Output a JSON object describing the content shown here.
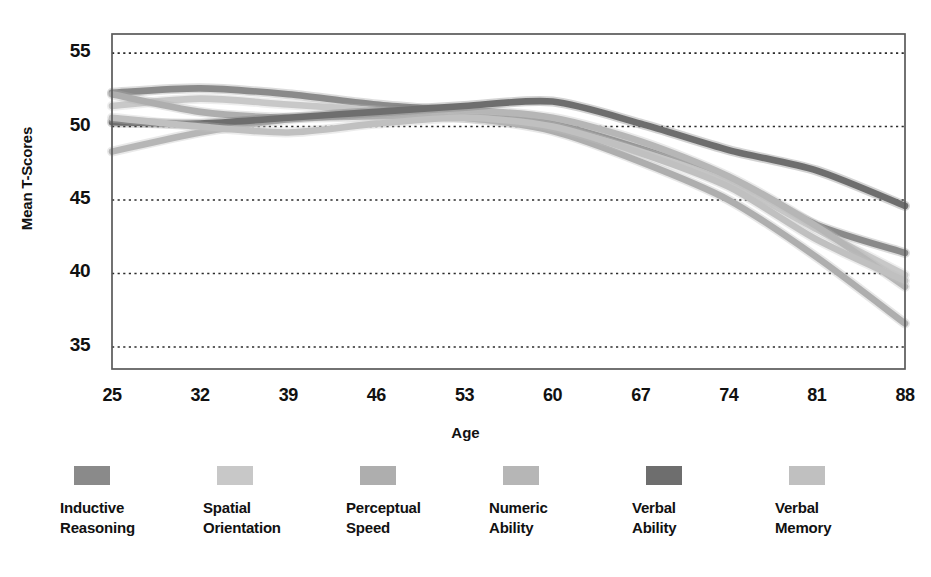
{
  "chart_data": {
    "type": "line",
    "title": "",
    "xlabel": "Age",
    "ylabel": "Mean T-Scores",
    "x": [
      25,
      32,
      39,
      46,
      53,
      60,
      67,
      74,
      81,
      88
    ],
    "xticklabels": [
      "25",
      "32",
      "39",
      "46",
      "53",
      "60",
      "67",
      "74",
      "81",
      "88"
    ],
    "yticklabels": [
      "35",
      "40",
      "45",
      "50",
      "55"
    ],
    "yticks": [
      35,
      40,
      45,
      50,
      55
    ],
    "xlim": [
      25,
      88
    ],
    "ylim": [
      33.5,
      56.3
    ],
    "grid": "horizontal-dotted",
    "legend_position": "below-plot",
    "series": [
      {
        "name": "Inductive Reasoning",
        "color": "#8a8a8a",
        "values": [
          52.3,
          52.6,
          52.2,
          51.5,
          51.0,
          50.2,
          48.5,
          46.4,
          43.3,
          41.4
        ]
      },
      {
        "name": "Spatial Orientation",
        "color": "#c8c8c8",
        "values": [
          51.4,
          51.9,
          51.5,
          51.1,
          50.6,
          49.9,
          48.3,
          46.2,
          43.0,
          39.9
        ]
      },
      {
        "name": "Perceptual Speed",
        "color": "#aeaeae",
        "values": [
          52.2,
          51.0,
          50.6,
          50.7,
          50.6,
          49.7,
          47.6,
          45.0,
          41.1,
          36.6
        ]
      },
      {
        "name": "Numeric Ability",
        "color": "#b6b6b6",
        "values": [
          48.3,
          49.6,
          50.5,
          51.0,
          51.1,
          50.6,
          49.0,
          46.6,
          43.2,
          39.1
        ]
      },
      {
        "name": "Verbal Ability",
        "color": "#6e6e6e",
        "values": [
          50.3,
          50.2,
          50.6,
          51.0,
          51.4,
          51.7,
          50.2,
          48.4,
          47.0,
          44.6
        ]
      },
      {
        "name": "Verbal Memory",
        "color": "#c0c0c0",
        "values": [
          50.6,
          50.0,
          49.6,
          50.2,
          50.6,
          50.0,
          48.2,
          45.9,
          42.3,
          39.5
        ]
      }
    ]
  },
  "legend": {
    "items": [
      {
        "label": "Inductive\nReasoning",
        "color": "#8a8a8a",
        "swatch_name": "legend-swatch-inductive-reasoning"
      },
      {
        "label": "Spatial\nOrientation",
        "color": "#c8c8c8",
        "swatch_name": "legend-swatch-spatial-orientation"
      },
      {
        "label": "Perceptual\nSpeed",
        "color": "#aeaeae",
        "swatch_name": "legend-swatch-perceptual-speed"
      },
      {
        "label": "Numeric\nAbility",
        "color": "#b6b6b6",
        "swatch_name": "legend-swatch-numeric-ability"
      },
      {
        "label": "Verbal\nAbility",
        "color": "#6e6e6e",
        "swatch_name": "legend-swatch-verbal-ability"
      },
      {
        "label": "Verbal\nMemory",
        "color": "#c0c0c0",
        "swatch_name": "legend-swatch-verbal-memory"
      }
    ]
  },
  "axis": {
    "frame_color": "#5a5a5a",
    "grid_color": "#2b2b2b",
    "text_color": "#111111"
  }
}
